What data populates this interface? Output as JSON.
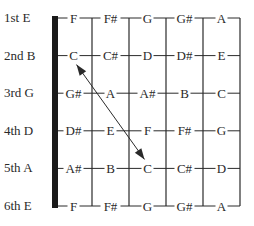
{
  "diagram": {
    "type": "guitar-fretboard",
    "strings": [
      {
        "label": "1st E",
        "notes": [
          "F",
          "F#",
          "G",
          "G#",
          "A"
        ]
      },
      {
        "label": "2nd B",
        "notes": [
          "C",
          "C#",
          "D",
          "D#",
          "E"
        ]
      },
      {
        "label": "3rd G",
        "notes": [
          "G#",
          "A",
          "A#",
          "B",
          "C"
        ]
      },
      {
        "label": "4th D",
        "notes": [
          "D#",
          "E",
          "F",
          "F#",
          "G"
        ]
      },
      {
        "label": "5th A",
        "notes": [
          "A#",
          "B",
          "C",
          "C#",
          "D"
        ]
      },
      {
        "label": "6th E",
        "notes": [
          "F",
          "F#",
          "G",
          "G#",
          "A"
        ]
      }
    ],
    "frets_shown": 5,
    "arrow": {
      "style": "double-headed",
      "from": {
        "string": "2nd B",
        "note": "C",
        "fret": 1
      },
      "to": {
        "string": "5th A",
        "note": "C",
        "fret": 3
      }
    },
    "colors": {
      "ink": "#2a2a2a",
      "nut": "#1a1a1a",
      "background": "#ffffff"
    }
  }
}
